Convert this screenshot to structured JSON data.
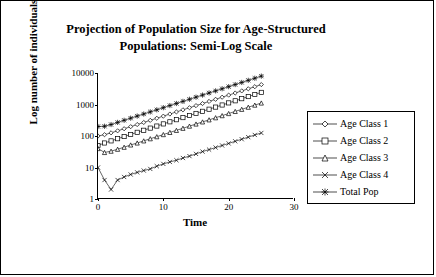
{
  "chart_data": {
    "type": "line",
    "title": "Projection of Population Size for Age-Structured Populations: Semi-Log Scale",
    "title_line1": "Projection of Population Size for Age-Structured",
    "title_line2": "Populations: Semi-Log Scale",
    "xlabel": "Time",
    "ylabel": "Log number of individuals",
    "yscale": "log",
    "ylim": [
      1,
      10000
    ],
    "xlim": [
      0,
      30
    ],
    "ytick_labels": [
      "1",
      "10",
      "100",
      "1000",
      "10000"
    ],
    "ytick_values": [
      1,
      10,
      100,
      1000,
      10000
    ],
    "xtick_labels": [
      "0",
      "10",
      "20",
      "30"
    ],
    "xtick_values": [
      0,
      10,
      20,
      30
    ],
    "grid": false,
    "legend_position": "right",
    "x": [
      0,
      1,
      2,
      3,
      4,
      5,
      6,
      7,
      8,
      9,
      10,
      11,
      12,
      13,
      14,
      15,
      16,
      17,
      18,
      19,
      20,
      21,
      22,
      23,
      24,
      25
    ],
    "series": [
      {
        "name": "Age Class 1",
        "marker": "diamond",
        "values": [
          100,
          110,
          126,
          146,
          170,
          198,
          231,
          269,
          314,
          366,
          427,
          498,
          581,
          677,
          790,
          921,
          1074,
          1253,
          1461,
          1704,
          1987,
          2317,
          2702,
          3151,
          3674,
          4285
        ]
      },
      {
        "name": "Age Class 2",
        "marker": "square",
        "values": [
          50,
          60,
          70,
          82,
          96,
          112,
          131,
          152,
          178,
          207,
          242,
          282,
          329,
          383,
          447,
          521,
          608,
          709,
          827,
          964,
          1124,
          1311,
          1529,
          1783,
          2079,
          2424
        ]
      },
      {
        "name": "Age Class 3",
        "marker": "triangle",
        "values": [
          40,
          30,
          33,
          38,
          44,
          52,
          60,
          70,
          82,
          95,
          111,
          130,
          151,
          176,
          206,
          240,
          280,
          326,
          380,
          443,
          517,
          603,
          703,
          820,
          956,
          1115
        ]
      },
      {
        "name": "Age Class 4",
        "marker": "x",
        "values": [
          10,
          4,
          2,
          4,
          5,
          6,
          7,
          8,
          9,
          11,
          13,
          15,
          17,
          20,
          23,
          27,
          32,
          37,
          43,
          50,
          58,
          68,
          79,
          92,
          108,
          125
        ]
      },
      {
        "name": "Total Pop",
        "marker": "asterisk",
        "values": [
          200,
          204,
          231,
          270,
          315,
          368,
          429,
          499,
          583,
          679,
          793,
          925,
          1078,
          1256,
          1466,
          1709,
          1994,
          2325,
          2709,
          3161,
          3686,
          4299,
          5013,
          5846,
          6817,
          7949
        ]
      }
    ]
  }
}
